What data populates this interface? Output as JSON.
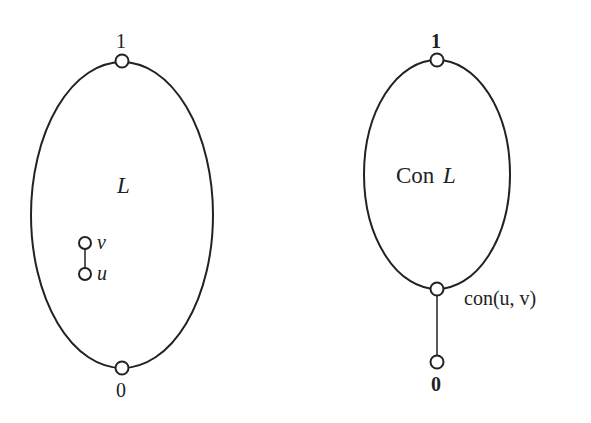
{
  "diagrams": [
    {
      "id": "lattice-L",
      "region_label": "L",
      "top_label": "1",
      "bottom_label": "0",
      "inner_nodes": [
        {
          "label": "v"
        },
        {
          "label": "u"
        }
      ]
    },
    {
      "id": "congruence-lattice",
      "region_label_prefix": "Con",
      "region_label_var": "L",
      "top_label": "1",
      "bottom_label": "0",
      "join_node_label": "con(u, v)"
    }
  ],
  "colors": {
    "stroke": "#222222",
    "background": "#ffffff"
  }
}
